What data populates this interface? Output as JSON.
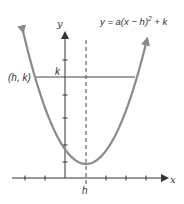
{
  "diagram": {
    "equation": {
      "prefix": "y = a(x − h)",
      "exponent": "2",
      "suffix": " + k"
    },
    "axes": {
      "x_label": "x",
      "y_label": "y",
      "x_ticks_count": 6,
      "y_ticks_count": 5
    },
    "labels": {
      "point": "(h, k)",
      "k_mark": "k",
      "h_mark": "h"
    },
    "colors": {
      "curve": "#8a8a8a",
      "axis": "#333333",
      "guide": "#444444"
    }
  }
}
